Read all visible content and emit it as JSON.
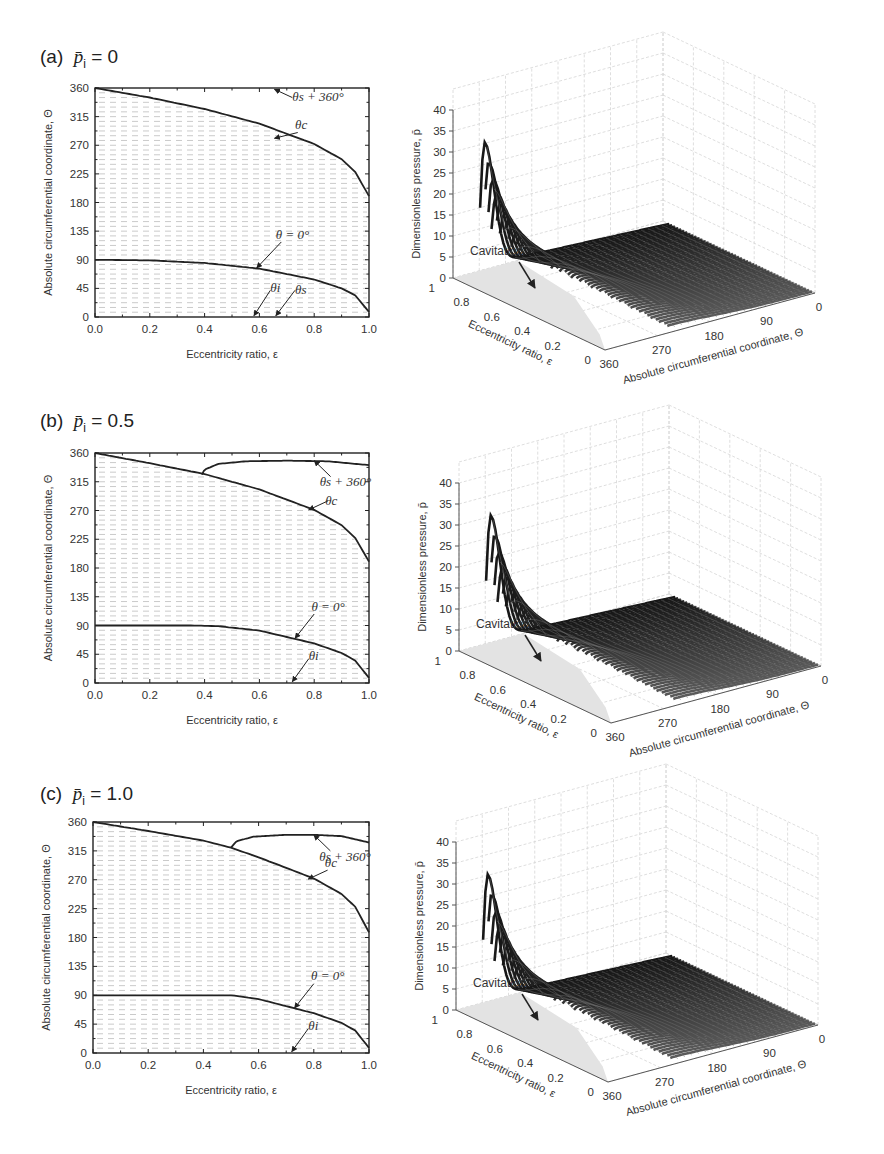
{
  "figure": {
    "panels": [
      {
        "id": "a",
        "title_prefix": "(a)",
        "title_param": "p̄",
        "title_sub": "i",
        "title_eq": " = 0"
      },
      {
        "id": "b",
        "title_prefix": "(b)",
        "title_param": "p̄",
        "title_sub": "i",
        "title_eq": " = 0.5"
      },
      {
        "id": "c",
        "title_prefix": "(c)",
        "title_param": "p̄",
        "title_sub": "i",
        "title_eq": " = 1.0"
      }
    ]
  },
  "chart_data": [
    {
      "panel": "a",
      "type": "line",
      "title": "(a) p̄i = 0",
      "xlabel": "Eccentricity ratio, ε",
      "ylabel": "Absolute circumferential coordinate, Θ",
      "xlim": [
        0,
        1
      ],
      "ylim": [
        0,
        360
      ],
      "xticks": [
        "0.0",
        "0.2",
        "0.4",
        "0.6",
        "0.8",
        "1.0"
      ],
      "yticks": [
        "0",
        "45",
        "90",
        "135",
        "180",
        "225",
        "270",
        "315",
        "360"
      ],
      "grid": "dashed horizontal every 15",
      "hatched_region": "between θ=0° curve and θc curve",
      "series": [
        {
          "name": "θc",
          "x": [
            0,
            0.2,
            0.4,
            0.6,
            0.8,
            0.9,
            0.95,
            1.0
          ],
          "y": [
            360,
            345,
            327,
            304,
            272,
            248,
            228,
            190
          ]
        },
        {
          "name": "θ = 0°",
          "x": [
            0,
            0.2,
            0.4,
            0.6,
            0.8,
            0.9,
            0.95,
            1.0
          ],
          "y": [
            90,
            89,
            85,
            76,
            59,
            45,
            34,
            8
          ]
        }
      ],
      "annotations": [
        "θs + 360°",
        "θc",
        "θ = 0°",
        "θi",
        "θs"
      ]
    },
    {
      "panel": "b",
      "type": "line",
      "title": "(b) p̄i = 0.5",
      "xlabel": "Eccentricity ratio, ε",
      "ylabel": "Absolute circumferential coordinate, Θ",
      "xlim": [
        0,
        1
      ],
      "ylim": [
        0,
        360
      ],
      "xticks": [
        "0.0",
        "0.2",
        "0.4",
        "0.6",
        "0.8",
        "1.0"
      ],
      "yticks": [
        "0",
        "45",
        "90",
        "135",
        "180",
        "225",
        "270",
        "315",
        "360"
      ],
      "grid": "dashed horizontal every 15",
      "series": [
        {
          "name": "θc",
          "x": [
            0,
            0.2,
            0.4,
            0.6,
            0.8,
            0.9,
            0.95,
            1.0
          ],
          "y": [
            360,
            344,
            327,
            303,
            271,
            247,
            227,
            190
          ]
        },
        {
          "name": "θs + 360°",
          "x": [
            0.39,
            0.4,
            0.45,
            0.55,
            0.7,
            0.85,
            1.0
          ],
          "y": [
            326,
            334,
            343,
            347,
            348,
            347,
            341
          ]
        },
        {
          "name": "θ = 0°",
          "x": [
            0,
            0.2,
            0.35,
            0.45,
            0.6,
            0.8,
            0.9,
            0.95,
            1.0
          ],
          "y": [
            90,
            90,
            90,
            89,
            82,
            62,
            47,
            35,
            8
          ]
        }
      ],
      "annotations": [
        "θs + 360°",
        "θc",
        "θ = 0°",
        "θi"
      ]
    },
    {
      "panel": "c",
      "type": "line",
      "title": "(c) p̄i = 1.0",
      "xlabel": "Eccentricity ratio, ε",
      "ylabel": "Absolute circumferential coordinate, Θ",
      "xlim": [
        0,
        1
      ],
      "ylim": [
        0,
        360
      ],
      "xticks": [
        "0.0",
        "0.2",
        "0.4",
        "0.6",
        "0.8",
        "1.0"
      ],
      "yticks": [
        "0",
        "45",
        "90",
        "135",
        "180",
        "225",
        "270",
        "315",
        "360"
      ],
      "grid": "dashed horizontal every 15",
      "series": [
        {
          "name": "θc",
          "x": [
            0,
            0.2,
            0.4,
            0.5,
            0.6,
            0.8,
            0.9,
            0.95,
            1.0
          ],
          "y": [
            360,
            346,
            331,
            320,
            305,
            272,
            248,
            228,
            188
          ]
        },
        {
          "name": "θs + 360°",
          "x": [
            0.5,
            0.52,
            0.58,
            0.7,
            0.8,
            0.9,
            1.0
          ],
          "y": [
            320,
            330,
            337,
            340,
            340,
            338,
            328
          ]
        },
        {
          "name": "θ = 0°",
          "x": [
            0,
            0.2,
            0.4,
            0.5,
            0.6,
            0.8,
            0.9,
            0.95,
            1.0
          ],
          "y": [
            90,
            90,
            90,
            90,
            84,
            62,
            47,
            35,
            8
          ]
        }
      ],
      "annotations": [
        "θs + 360°",
        "θc",
        "θ = 0°",
        "θi"
      ]
    },
    {
      "panel": "a-3d",
      "type": "surface",
      "zlabel": "Dimensionless pressure, p̄",
      "xlabel": "Eccentricity ratio, ε",
      "ylabel": "Absolute circumferential coordinate, Θ",
      "zticks": [
        "0",
        "5",
        "10",
        "15",
        "20",
        "25",
        "30",
        "35",
        "40"
      ],
      "eps_ticks": [
        "0",
        "0.2",
        "0.4",
        "0.6",
        "0.8",
        "1"
      ],
      "theta_ticks": [
        "360",
        "270",
        "180",
        "90",
        "0"
      ],
      "peak_value": 42,
      "annotation": "Cavitation"
    },
    {
      "panel": "b-3d",
      "type": "surface",
      "zlabel": "Dimensionless pressure, p̄",
      "xlabel": "Eccentricity ratio, ε",
      "ylabel": "Absolute circumferential coordinate, Θ",
      "zticks": [
        "0",
        "5",
        "10",
        "15",
        "20",
        "25",
        "30",
        "35",
        "40"
      ],
      "eps_ticks": [
        "0",
        "0.2",
        "0.4",
        "0.6",
        "0.8",
        "1"
      ],
      "theta_ticks": [
        "360",
        "270",
        "180",
        "90",
        "0"
      ],
      "peak_value": 42,
      "annotation": "Cavitation"
    },
    {
      "panel": "c-3d",
      "type": "surface",
      "zlabel": "Dimensionless pressure, p̄",
      "xlabel": "Eccentricity ratio, ε",
      "ylabel": "Absolute circumferential coordinate, Θ",
      "zticks": [
        "0",
        "5",
        "10",
        "15",
        "20",
        "25",
        "30",
        "35",
        "40"
      ],
      "eps_ticks": [
        "0",
        "0.2",
        "0.4",
        "0.6",
        "0.8",
        "1"
      ],
      "theta_ticks": [
        "360",
        "270",
        "180",
        "90",
        "0"
      ],
      "peak_value": 42,
      "annotation": "Cavitation"
    }
  ]
}
